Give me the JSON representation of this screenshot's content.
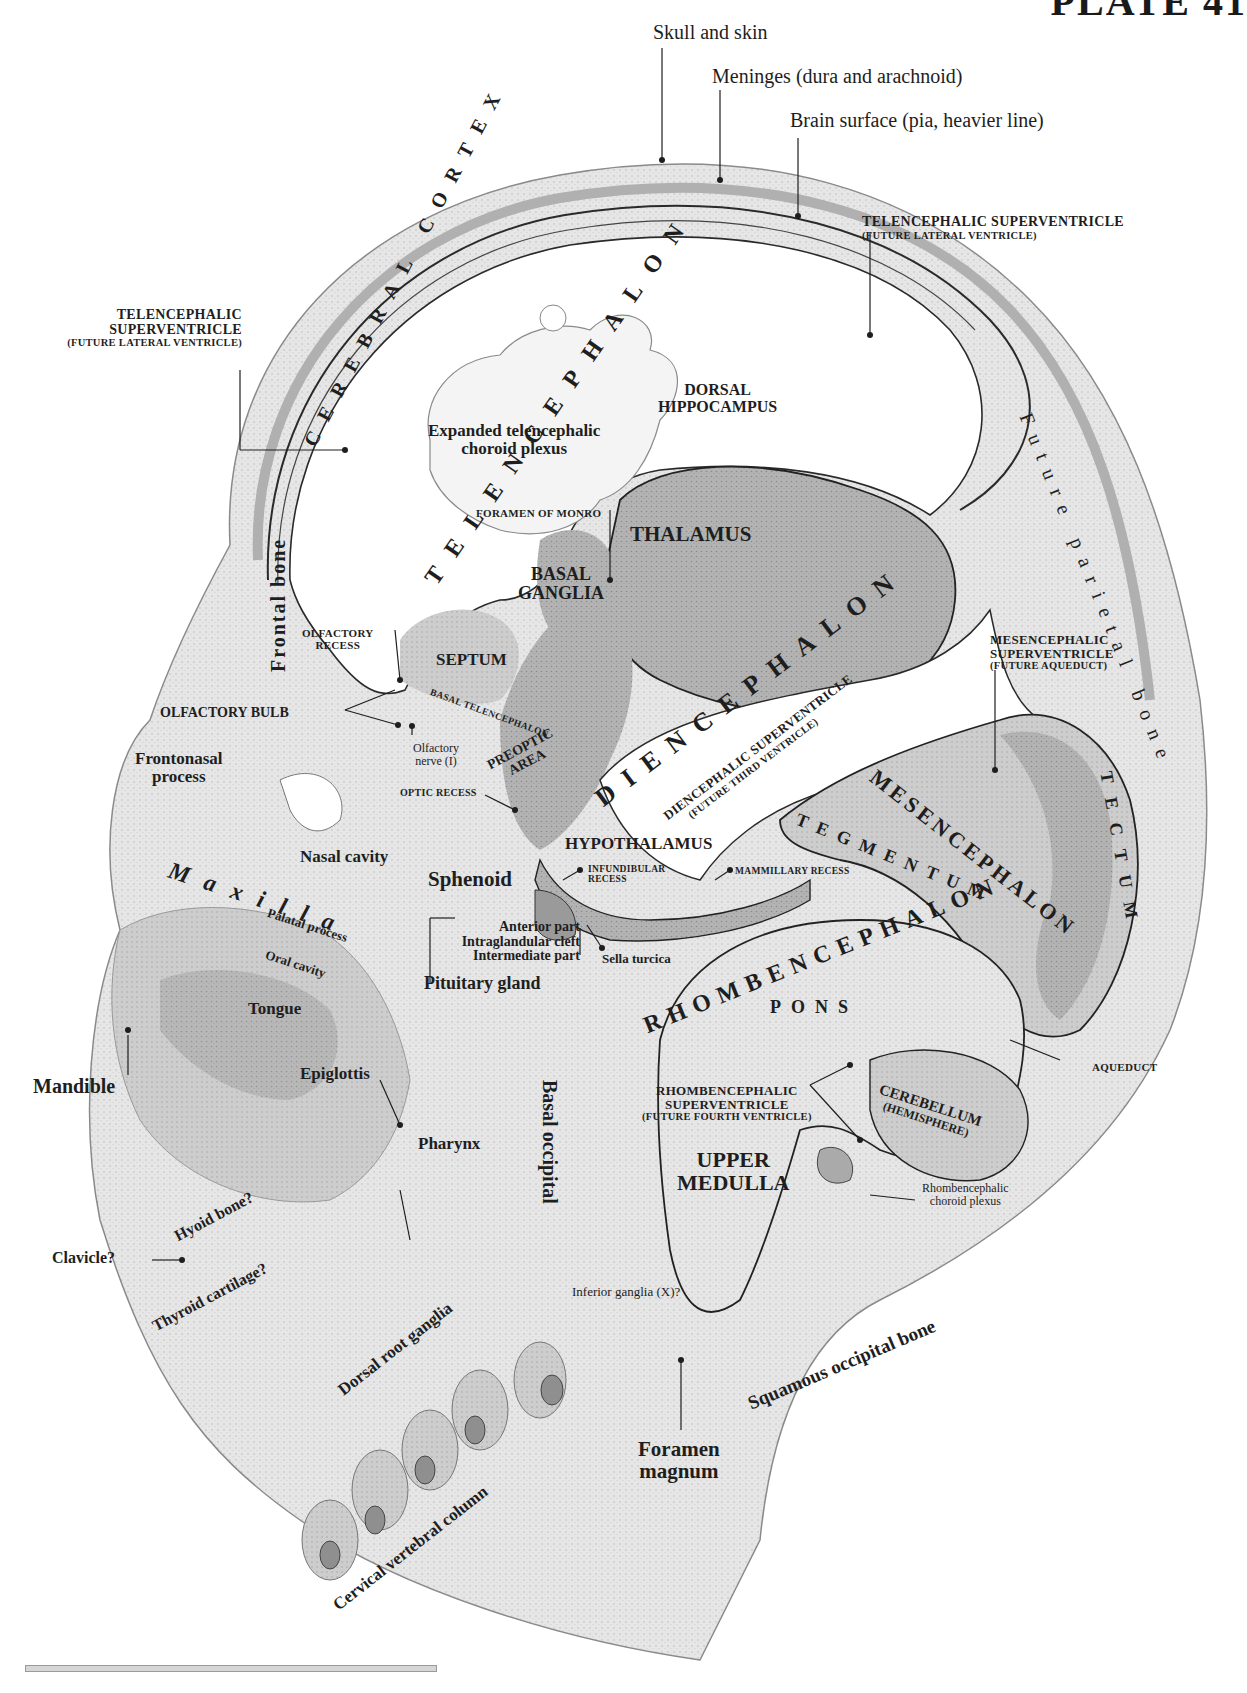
{
  "plate": {
    "title": "PLATE 41"
  },
  "layers": {
    "skull": "Skull and skin",
    "meninges": "Meninges (dura and arachnoid)",
    "brain_surface": "Brain surface (pia, heavier line)"
  },
  "regions": {
    "cerebral_cortex": "CEREBRAL CORTEX",
    "telencephalon": "TELENCEPHALON",
    "diencephalon": "DIENCEPHALON",
    "mesencephalon": "MESENCEPHALON",
    "rhombencephalon": "RHOMBENCEPHALON",
    "tectum": "TECTUM",
    "tegmentum": "TEGMENTUM",
    "pons": "PONS"
  },
  "ventricles": {
    "tel_right": {
      "title": "TELENCEPHALIC SUPERVENTRICLE",
      "sub": "(FUTURE LATERAL VENTRICLE)"
    },
    "tel_left": {
      "line1": "TELENCEPHALIC",
      "line2": "SUPERVENTRICLE",
      "sub": "(FUTURE LATERAL VENTRICLE)"
    },
    "mes": {
      "line1": "MESENCEPHALIC",
      "line2": "SUPERVENTRICLE",
      "sub": "(FUTURE AQUEDUCT)"
    },
    "dien": {
      "title": "DIENCEPHALIC SUPERVENTRICLE",
      "sub": "(FUTURE THIRD VENTRICLE)"
    },
    "rhomb": {
      "line1": "RHOMBENCEPHALIC",
      "line2": "SUPERVENTRICLE",
      "sub": "(FUTURE FOURTH VENTRICLE)"
    }
  },
  "structures": {
    "dorsal_hippocampus": [
      "DORSAL",
      "HIPPOCAMPUS"
    ],
    "choroid_plexus": [
      "Expanded telencephalic",
      "choroid plexus"
    ],
    "foramen_monro": "FORAMEN OF MONRO",
    "thalamus": "THALAMUS",
    "basal_ganglia": [
      "BASAL",
      "GANGLIA"
    ],
    "olfactory_recess": [
      "OLFACTORY",
      "RECESS"
    ],
    "septum": "SEPTUM",
    "basal_telencephalon": "BASAL TELENCEPHALON",
    "olfactory_bulb": "OLFACTORY BULB",
    "olfactory_nerve": [
      "Olfactory",
      "nerve (I)"
    ],
    "preoptic_area": [
      "PREOPTIC",
      "AREA"
    ],
    "optic_recess": "OPTIC RECESS",
    "hypothalamus": "HYPOTHALAMUS",
    "infundibular_recess": [
      "INFUNDIBULAR",
      "RECESS"
    ],
    "mammillary_recess": "MAMMILLARY RECESS",
    "aqueduct": "AQUEDUCT",
    "cerebellum": [
      "CEREBELLUM",
      "(HEMISPHERE)"
    ],
    "upper_medulla": [
      "UPPER",
      "MEDULLA"
    ],
    "rhomb_choroid": [
      "Rhombencephalic",
      "choroid plexus"
    ]
  },
  "bones_and_other": {
    "frontal_bone": "Frontal bone",
    "future_parietal_bone": "Future parietal bone",
    "frontonasal_process": [
      "Frontonasal",
      "process"
    ],
    "nasal_cavity": "Nasal cavity",
    "sphenoid": "Sphenoid",
    "maxilla": "Maxilla",
    "palatal_process": "Palatal process",
    "oral_cavity": "Oral cavity",
    "tongue": "Tongue",
    "mandible": "Mandible",
    "epiglottis": "Epiglottis",
    "pharynx": "Pharynx",
    "hyoid": "Hyoid bone?",
    "clavicle": "Clavicle?",
    "thyroid": "Thyroid cartilage?",
    "pituitary": {
      "title": "Pituitary gland",
      "anterior": "Anterior part",
      "cleft": "Intraglandular cleft",
      "intermediate": "Intermediate part"
    },
    "sella_turcica": "Sella turcica",
    "basal_occipital": "Basal occipital",
    "inferior_ganglia": "Inferior ganglia (X)?",
    "squamous_occipital": "Squamous occipital bone",
    "foramen_magnum": [
      "Foramen",
      "magnum"
    ],
    "dorsal_root_ganglia": "Dorsal root ganglia",
    "cervical_column": "Cervical vertebral column"
  },
  "colors": {
    "ink": "#1e1e1e",
    "tissue_light": "#e4e4e4",
    "tissue_mid": "#bdbdbd",
    "tissue_dark": "#9c9c9c",
    "paper": "#ffffff"
  }
}
